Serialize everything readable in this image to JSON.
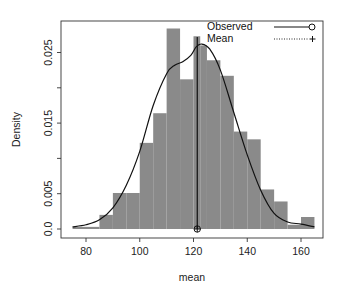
{
  "chart_data": {
    "type": "bar",
    "subtype": "histogram_with_density",
    "title": "",
    "xlabel": "mean",
    "ylabel": "Density",
    "xlim": [
      72,
      168
    ],
    "ylim": [
      -0.0013,
      0.0295
    ],
    "x_ticks": [
      80,
      100,
      120,
      140,
      160
    ],
    "x_tick_labels": [
      "80",
      "100",
      "120",
      "140",
      "160"
    ],
    "y_ticks": [
      0.0,
      0.005,
      0.01,
      0.015,
      0.02,
      0.025
    ],
    "y_tick_labels": [
      "0.0",
      "0.005",
      "",
      "0.015",
      "",
      "0.025"
    ],
    "grid": false,
    "bar_color": "#8a8a8a",
    "bins": [
      {
        "from": 75,
        "to": 80,
        "density": 0.0003
      },
      {
        "from": 80,
        "to": 85,
        "density": 0.0003
      },
      {
        "from": 85,
        "to": 90,
        "density": 0.002
      },
      {
        "from": 90,
        "to": 95,
        "density": 0.0051
      },
      {
        "from": 95,
        "to": 100,
        "density": 0.0051
      },
      {
        "from": 100,
        "to": 105,
        "density": 0.0122
      },
      {
        "from": 105,
        "to": 110,
        "density": 0.0164
      },
      {
        "from": 110,
        "to": 115,
        "density": 0.0284
      },
      {
        "from": 115,
        "to": 120,
        "density": 0.0212
      },
      {
        "from": 120,
        "to": 122.5,
        "density": 0.0273
      },
      {
        "from": 122.5,
        "to": 125,
        "density": 0.026
      },
      {
        "from": 125,
        "to": 130,
        "density": 0.0239
      },
      {
        "from": 130,
        "to": 135,
        "density": 0.0217
      },
      {
        "from": 135,
        "to": 140,
        "density": 0.0138
      },
      {
        "from": 140,
        "to": 145,
        "density": 0.0127
      },
      {
        "from": 145,
        "to": 150,
        "density": 0.0056
      },
      {
        "from": 150,
        "to": 155,
        "density": 0.0039
      },
      {
        "from": 155,
        "to": 160,
        "density": 0.0006
      },
      {
        "from": 160,
        "to": 165,
        "density": 0.0017
      }
    ],
    "series": [
      {
        "name": "Observed",
        "type": "line",
        "style": "solid",
        "marker": "circle",
        "x": [
          75,
          80,
          85,
          90,
          95,
          100,
          105,
          110,
          113,
          116,
          119,
          121,
          123,
          126,
          130,
          135,
          140,
          145,
          150,
          155,
          160,
          165
        ],
        "y": [
          0.0003,
          0.0006,
          0.0013,
          0.003,
          0.0062,
          0.011,
          0.0175,
          0.022,
          0.0232,
          0.0237,
          0.0246,
          0.0258,
          0.0262,
          0.0255,
          0.0225,
          0.0165,
          0.0105,
          0.0055,
          0.0022,
          0.001,
          0.0007,
          0.0003
        ]
      },
      {
        "name": "Mean",
        "type": "vline",
        "style": "dotted",
        "marker": "plus",
        "x": 121.4
      }
    ],
    "annotations": [
      {
        "type": "mean_line",
        "x": 121.4,
        "y_top": 0.0272
      }
    ],
    "legend": {
      "position": "top-right",
      "entries": [
        "Observed",
        "Mean"
      ]
    }
  },
  "axes": {
    "xlabel": "mean",
    "ylabel": "Density"
  },
  "legend": {
    "observed_label": "Observed",
    "mean_label": "Mean"
  }
}
